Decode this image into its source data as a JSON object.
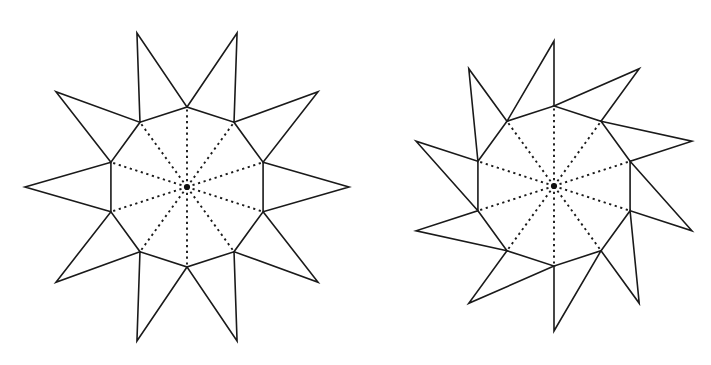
{
  "page": {
    "background_color": "#ffffff",
    "width": 711,
    "height": 365,
    "stroke_color": "#1a1a1a",
    "center_dot_color": "#111111"
  },
  "figures": [
    {
      "name": "left-decagram",
      "label": "Decagon with ten outward triangular spikes (non-overlapping)",
      "center": {
        "x": 187,
        "y": 187
      },
      "polygon_sides": 10,
      "polygon_circumradius": 80,
      "polygon_rotation_deg": -90,
      "spike_apex_radius": 162,
      "spike_overlap": false,
      "radial_spokes": 10,
      "radial_style": "dashed",
      "center_dot_radius": 3.1,
      "extents": {
        "top_y": 25,
        "bottom_y": 348,
        "left_x": 29,
        "right_x": 345
      }
    },
    {
      "name": "right-decagram",
      "label": "Decagon with ten large overlapping triangles",
      "center": {
        "x": 554,
        "y": 186
      },
      "polygon_sides": 10,
      "polygon_circumradius": 80,
      "polygon_rotation_deg": -90,
      "spike_apex_radius": 145,
      "spike_overlap": true,
      "spike_apex_offset_deg": 18,
      "radial_spokes": 10,
      "radial_style": "dashed",
      "center_dot_radius": 3.1,
      "extents": {
        "top_y": 44,
        "bottom_y": 330,
        "left_x": 424,
        "right_x": 686
      }
    }
  ]
}
